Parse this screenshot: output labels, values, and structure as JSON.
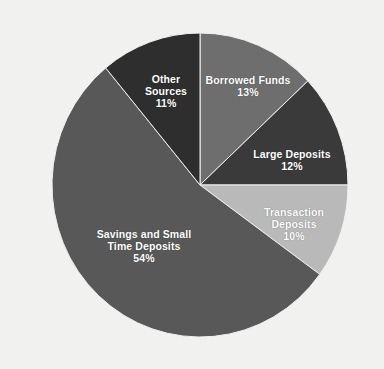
{
  "background_color": "#f1f1f0",
  "chart_data": {
    "type": "pie",
    "title": "",
    "subtitle": "",
    "xlabel": "",
    "ylabel": "",
    "legend": "none",
    "grid": false,
    "label_color": "#ffffff",
    "units": "percent",
    "start_angle_deg": 0,
    "direction": "clockwise",
    "categories": [
      "Borrowed Funds",
      "Large Deposits",
      "Transaction Deposits",
      "Savings and Small Time Deposits",
      "Other Sources"
    ],
    "values": [
      13,
      12,
      10,
      54,
      11
    ],
    "colors": [
      "#6e6e6e",
      "#3a3a3a",
      "#b9b9b9",
      "#585858",
      "#2e2e2e"
    ],
    "slices": [
      {
        "name": "Borrowed Funds",
        "value": 13,
        "label": "Borrowed Funds",
        "percent_label": "13%",
        "color": "#6e6e6e",
        "start_deg": 0,
        "end_deg": 46.8
      },
      {
        "name": "Large Deposits",
        "value": 12,
        "label": "Large Deposits",
        "percent_label": "12%",
        "color": "#3a3a3a",
        "start_deg": 46.8,
        "end_deg": 90
      },
      {
        "name": "Transaction Deposits",
        "value": 10,
        "label": "Transaction\nDeposits",
        "percent_label": "10%",
        "color": "#b9b9b9",
        "start_deg": 90,
        "end_deg": 126
      },
      {
        "name": "Savings and Small Time Deposits",
        "value": 54,
        "label": "Savings and Small\nTime Deposits",
        "percent_label": "54%",
        "color": "#585858",
        "start_deg": 126,
        "end_deg": 320.4
      },
      {
        "name": "Other Sources",
        "value": 11,
        "label": "Other\nSources",
        "percent_label": "11%",
        "color": "#2e2e2e",
        "start_deg": 320.4,
        "end_deg": 360
      }
    ]
  }
}
